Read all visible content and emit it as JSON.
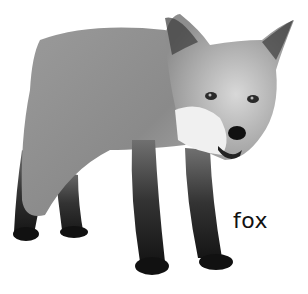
{
  "image": {
    "subject": "fox",
    "style": "grayscale photograph on white background",
    "background_color": "#ffffff"
  },
  "caption": {
    "text": "fox",
    "color": "#111111"
  }
}
